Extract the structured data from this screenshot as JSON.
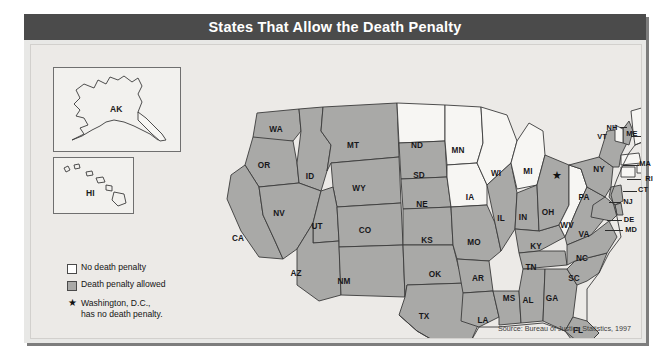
{
  "title": "States That Allow the Death Penalty",
  "source": "Source: Bureau of Justice Statistics, 1997",
  "legend": {
    "no_label": "No death penalty",
    "allowed_label": "Death penalty allowed",
    "star_line1": "Washington, D.C.,",
    "star_line2": "has no death penalty.",
    "star_glyph": "★"
  },
  "colors": {
    "allowed_fill": "#a9a9a7",
    "no_fill": "#f7f6f3",
    "title_bar": "#4b4b4b",
    "panel_bg": "#e8e8e6",
    "map_bg": "#eceae7",
    "border": "#3b3b3b"
  },
  "insets": [
    {
      "code": "AK",
      "status": "no"
    },
    {
      "code": "HI",
      "status": "no"
    }
  ],
  "dc_marker": {
    "glyph": "★",
    "x": 557,
    "y": 175
  },
  "map_data": {
    "type": "choropleth",
    "categories": [
      "No death penalty",
      "Death penalty allowed"
    ],
    "states": [
      {
        "code": "WA",
        "status": "allowed",
        "x": 245,
        "y": 84
      },
      {
        "code": "OR",
        "status": "allowed",
        "x": 233,
        "y": 120
      },
      {
        "code": "CA",
        "status": "allowed",
        "x": 207,
        "y": 193
      },
      {
        "code": "ID",
        "status": "allowed",
        "x": 279,
        "y": 131
      },
      {
        "code": "NV",
        "status": "allowed",
        "x": 248,
        "y": 168
      },
      {
        "code": "MT",
        "status": "allowed",
        "x": 322,
        "y": 100
      },
      {
        "code": "WY",
        "status": "allowed",
        "x": 328,
        "y": 143
      },
      {
        "code": "UT",
        "status": "allowed",
        "x": 286,
        "y": 181
      },
      {
        "code": "AZ",
        "status": "allowed",
        "x": 265,
        "y": 228
      },
      {
        "code": "CO",
        "status": "allowed",
        "x": 334,
        "y": 185
      },
      {
        "code": "NM",
        "status": "allowed",
        "x": 313,
        "y": 236
      },
      {
        "code": "ND",
        "status": "no",
        "x": 386,
        "y": 100
      },
      {
        "code": "SD",
        "status": "allowed",
        "x": 388,
        "y": 130
      },
      {
        "code": "NE",
        "status": "allowed",
        "x": 391,
        "y": 159
      },
      {
        "code": "KS",
        "status": "allowed",
        "x": 396,
        "y": 195
      },
      {
        "code": "OK",
        "status": "allowed",
        "x": 404,
        "y": 229
      },
      {
        "code": "TX",
        "status": "allowed",
        "x": 393,
        "y": 271
      },
      {
        "code": "MN",
        "status": "no",
        "x": 427,
        "y": 105
      },
      {
        "code": "IA",
        "status": "no",
        "x": 439,
        "y": 152
      },
      {
        "code": "MO",
        "status": "allowed",
        "x": 443,
        "y": 197
      },
      {
        "code": "AR",
        "status": "allowed",
        "x": 447,
        "y": 233
      },
      {
        "code": "LA",
        "status": "allowed",
        "x": 452,
        "y": 275
      },
      {
        "code": "WI",
        "status": "no",
        "x": 465,
        "y": 128
      },
      {
        "code": "IL",
        "status": "allowed",
        "x": 470,
        "y": 173
      },
      {
        "code": "MS",
        "status": "allowed",
        "x": 478,
        "y": 253
      },
      {
        "code": "MI",
        "status": "no",
        "x": 497,
        "y": 126
      },
      {
        "code": "IN",
        "status": "allowed",
        "x": 492,
        "y": 172
      },
      {
        "code": "KY",
        "status": "allowed",
        "x": 505,
        "y": 201
      },
      {
        "code": "TN",
        "status": "allowed",
        "x": 500,
        "y": 222
      },
      {
        "code": "AL",
        "status": "allowed",
        "x": 497,
        "y": 255
      },
      {
        "code": "OH",
        "status": "allowed",
        "x": 517,
        "y": 167
      },
      {
        "code": "GA",
        "status": "allowed",
        "x": 521,
        "y": 253
      },
      {
        "code": "FL",
        "status": "allowed",
        "x": 547,
        "y": 285
      },
      {
        "code": "WV",
        "status": "no",
        "x": 536,
        "y": 180
      },
      {
        "code": "VA",
        "status": "allowed",
        "x": 553,
        "y": 189
      },
      {
        "code": "SC",
        "status": "allowed",
        "x": 543,
        "y": 233
      },
      {
        "code": "NC",
        "status": "allowed",
        "x": 551,
        "y": 213
      },
      {
        "code": "PA",
        "status": "allowed",
        "x": 553,
        "y": 152
      },
      {
        "code": "NY",
        "status": "allowed",
        "x": 568,
        "y": 124
      },
      {
        "code": "NH",
        "status": "allowed",
        "x": 581,
        "y": 82
      },
      {
        "code": "VT",
        "status": "no",
        "x": 571,
        "y": 91
      },
      {
        "code": "ME",
        "status": "no",
        "x": 601,
        "y": 88
      },
      {
        "code": "MA",
        "status": "no",
        "x": 614,
        "y": 118
      },
      {
        "code": "RI",
        "status": "no",
        "x": 618,
        "y": 133
      },
      {
        "code": "CT",
        "status": "no",
        "x": 612,
        "y": 144
      },
      {
        "code": "NJ",
        "status": "allowed",
        "x": 597,
        "y": 156
      },
      {
        "code": "DE",
        "status": "allowed",
        "x": 598,
        "y": 174
      },
      {
        "code": "MD",
        "status": "allowed",
        "x": 600,
        "y": 184
      },
      {
        "code": "AK",
        "status": "no",
        "x": 99,
        "y": 108
      },
      {
        "code": "HI",
        "status": "no",
        "x": 63,
        "y": 200
      }
    ]
  }
}
